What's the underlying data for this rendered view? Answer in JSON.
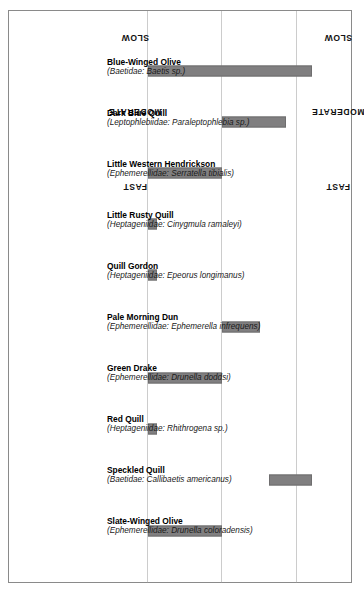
{
  "chart_data": {
    "type": "bar",
    "orientation": "vertical-rotated",
    "title": "",
    "xlabel": "",
    "ylabel": "",
    "axis_ticks": [
      "FAST",
      "MODERATE",
      "SLOW"
    ],
    "axis_tick_values": [
      0,
      1,
      2
    ],
    "ylim": [
      0,
      2.35
    ],
    "grid": true,
    "grid_style": "dotted",
    "legend": "none",
    "bar_color": "#807f80",
    "bar_edge_color": "#6f6e6f",
    "categories": [
      "Blue-Winged Olive",
      "Dark Blue Quill",
      "Little Western Hendrickson",
      "Little Rusty Quill",
      "Quill Gordon",
      "Pale Morning Dun",
      "Green Drake",
      "Red Quill",
      "Speckled Quill",
      "Slate-Winged Olive"
    ],
    "ranges": [
      {
        "category": "Blue-Winged Olive",
        "low": 0.0,
        "high": 2.2
      },
      {
        "category": "Dark Blue Quill",
        "low": 1.0,
        "high": 1.85
      },
      {
        "category": "Little Western Hendrickson",
        "low": 0.0,
        "high": 1.0
      },
      {
        "category": "Little Rusty Quill",
        "low": 0.0,
        "high": 0.12
      },
      {
        "category": "Quill Gordon",
        "low": 0.0,
        "high": 0.12
      },
      {
        "category": "Pale Morning Dun",
        "low": 1.0,
        "high": 1.5
      },
      {
        "category": "Green Drake",
        "low": 0.0,
        "high": 1.0
      },
      {
        "category": "Red Quill",
        "low": 0.0,
        "high": 0.12
      },
      {
        "category": "Speckled Quill",
        "low": 1.62,
        "high": 2.2
      },
      {
        "category": "Slate-Winged Olive",
        "low": 0.0,
        "high": 1.0
      }
    ]
  },
  "axis": {
    "tick_fast": "FAST",
    "tick_moderate": "MODERATE",
    "tick_slow": "SLOW"
  },
  "species": [
    {
      "common": "Blue-Winged Olive",
      "family": "(Baetidae:",
      "binomial": "Baetis sp.)",
      "sci_full": "(Baetidae: Baetis sp.)"
    },
    {
      "common": "Dark Blue Quill",
      "family": "(Leptophlebiidae:",
      "binomial": "Paraleptophlebia sp.)",
      "sci_full": "(Leptophlebiidae: Paraleptophlebia sp.)"
    },
    {
      "common": "Little Western Hendrickson",
      "family": "(Ephemerellidae:",
      "binomial": "Serratella tibialis)",
      "sci_full": "(Ephemerellidae: Serratella tibialis)"
    },
    {
      "common": "Little Rusty Quill",
      "family": "(Heptageniidae:",
      "binomial": "Cinygmula ramaleyi)",
      "sci_full": "(Heptageniidae: Cinygmula ramaleyi)"
    },
    {
      "common": "Quill Gordon",
      "family": "(Heptageniidae:",
      "binomial": "Epeorus longimanus)",
      "sci_full": "(Heptageniidae: Epeorus longimanus)"
    },
    {
      "common": "Pale Morning Dun",
      "family": "(Ephemerellidae:",
      "binomial": "Ephemerella infrequens)",
      "sci_full": "(Ephemerellidae: Ephemerella infrequens)"
    },
    {
      "common": "Green Drake",
      "family": "(Ephemerellidae:",
      "binomial": "Drunella doddsi)",
      "sci_full": "(Ephemerellidae: Drunella doddsi)"
    },
    {
      "common": "Red Quill",
      "family": "(Heptageniidae:",
      "binomial": "Rhithrogena sp.)",
      "sci_full": "(Heptageniidae: Rhithrogena sp.)"
    },
    {
      "common": "Speckled Quill",
      "family": "(Baetidae:",
      "binomial": "Callibaetis americanus)",
      "sci_full": "(Baetidae: Callibaetis americanus)"
    },
    {
      "common": "Slate-Winged Olive",
      "family": "(Ephemerellidae:",
      "binomial": "Drunella coloradensis)",
      "sci_full": "(Ephemerellidae: Drunella coloradensis)"
    }
  ]
}
